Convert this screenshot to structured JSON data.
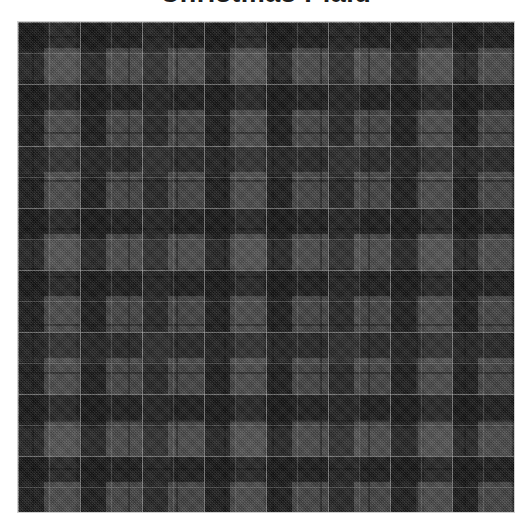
{
  "page": {
    "background_color": "#ffffff",
    "width": 531,
    "height": 525
  },
  "title": {
    "text": "Christmas Plaid",
    "color": "#1d1d1d",
    "cropped": "true"
  },
  "swatch": {
    "name": "plaid-fabric-swatch",
    "alt_text": "Dark charcoal grey tartan plaid fabric swatch",
    "border_color": "#cfcfcf",
    "x": 18,
    "y": 22,
    "width": 496,
    "height": 490
  },
  "chart_data": {
    "type": "heatmap",
    "title": "Christmas Plaid",
    "xlabel": "",
    "ylabel": "",
    "pattern": "tartan-sett",
    "repeat_px": 62,
    "thread_count": [
      {
        "color_name": "charcoal",
        "hex": "#1a1a1a",
        "threads": 26
      },
      {
        "color_name": "slate",
        "hex": "#4a4a4a",
        "threads": 36
      }
    ],
    "palette": {
      "darkest_block": "#1f1f1f",
      "dark_band": "#2c2c2c",
      "mid_ground": "#4a4a4a",
      "light_block": "#5c5c5c",
      "pinstripe": "#e1e1e1",
      "guard_line": "#0f0f0f"
    },
    "stripe_sequence_warp": [
      "dark",
      "guard",
      "dark",
      "pinstripe",
      "mid",
      "pinstripe"
    ],
    "stripe_sequence_weft": [
      "dark",
      "guard",
      "dark",
      "pinstripe",
      "mid",
      "pinstripe"
    ],
    "weave": "twill-2x2",
    "grid": "off",
    "legend": "none"
  }
}
